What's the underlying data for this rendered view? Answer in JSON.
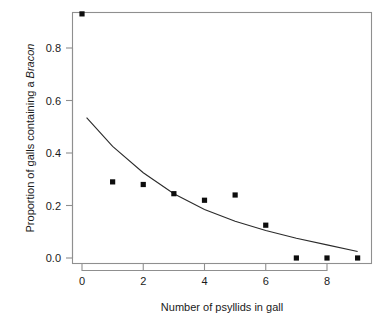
{
  "chart_data": {
    "type": "scatter",
    "title": "",
    "xlabel": "Number of psyllids in gall",
    "ylabel": "Proportion of galls containing a Bracon",
    "ylabel_plain": "Proportion of galls containing a ",
    "ylabel_italic": "Bracon",
    "x": [
      0,
      1,
      2,
      3,
      4,
      5,
      6,
      7,
      8,
      9
    ],
    "values": [
      0.93,
      0.29,
      0.28,
      0.245,
      0.22,
      0.24,
      0.125,
      0.0,
      0.0,
      0.0
    ],
    "series": [
      {
        "name": "observed proportions",
        "type": "scatter",
        "marker": "filled-square",
        "x": [
          0,
          1,
          2,
          3,
          4,
          5,
          6,
          7,
          8,
          9
        ],
        "values": [
          0.93,
          0.29,
          0.28,
          0.245,
          0.22,
          0.24,
          0.125,
          0.0,
          0.0,
          0.0
        ]
      },
      {
        "name": "fitted curve",
        "type": "line",
        "x": [
          0.15,
          1,
          2,
          3,
          4,
          5,
          6,
          7,
          8,
          9
        ],
        "values": [
          0.535,
          0.425,
          0.325,
          0.245,
          0.185,
          0.14,
          0.105,
          0.075,
          0.05,
          0.025
        ]
      }
    ],
    "xlim": [
      -0.38,
      9.38
    ],
    "ylim": [
      -0.038,
      0.968
    ],
    "xticks": [
      0,
      2,
      4,
      6,
      8
    ],
    "xtick_labels": [
      "0",
      "2",
      "4",
      "6",
      "8"
    ],
    "yticks": [
      0.0,
      0.2,
      0.4,
      0.6,
      0.8
    ],
    "ytick_labels": [
      "0.0",
      "0.2",
      "0.4",
      "0.6",
      "0.8"
    ],
    "grid": false,
    "legend": null,
    "frame": "box",
    "colors": {
      "point": "#0d0d0d",
      "curve": "#2b2b2b",
      "axis": "#8f8f8f",
      "text": "#1a1a1a",
      "background": "#ffffff"
    }
  },
  "axes": {
    "x_tick_labels": [
      "0",
      "2",
      "4",
      "6",
      "8"
    ],
    "y_tick_labels": [
      "0.0",
      "0.2",
      "0.4",
      "0.6",
      "0.8"
    ],
    "x_title": "Number of psyllids in gall",
    "y_title_plain": "Proportion of galls containing a ",
    "y_title_italic": "Bracon"
  }
}
